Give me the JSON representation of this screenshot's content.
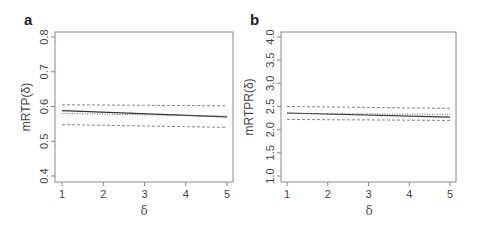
{
  "chart_data": [
    {
      "type": "line",
      "panel_label": "a",
      "title": "",
      "xlabel": "δ",
      "ylabel": "mRTP(δ)",
      "xlim": [
        1,
        5
      ],
      "ylim": [
        0.4,
        0.8
      ],
      "xticks": [
        "1",
        "2",
        "3",
        "4",
        "5"
      ],
      "yticks": [
        "0.4",
        "0.5",
        "0.6",
        "0.7",
        "0.8"
      ],
      "grid": false,
      "x": [
        1,
        5
      ],
      "series": [
        {
          "name": "upper bound",
          "style": "dashed",
          "values": [
            0.605,
            0.602
          ]
        },
        {
          "name": "estimate",
          "style": "solid",
          "values": [
            0.588,
            0.57
          ]
        },
        {
          "name": "reference",
          "style": "dotted",
          "values": [
            0.58,
            0.572
          ]
        },
        {
          "name": "lower bound",
          "style": "dashed",
          "values": [
            0.548,
            0.54
          ]
        }
      ]
    },
    {
      "type": "line",
      "panel_label": "b",
      "title": "",
      "xlabel": "δ",
      "ylabel": "mRTPR(δ)",
      "xlim": [
        1,
        5
      ],
      "ylim": [
        1.0,
        4.0
      ],
      "xticks": [
        "1",
        "2",
        "3",
        "4",
        "5"
      ],
      "yticks": [
        "1.0",
        "1.5",
        "2.0",
        "2.5",
        "3.0",
        "3.5",
        "4.0"
      ],
      "grid": false,
      "x": [
        1,
        5
      ],
      "series": [
        {
          "name": "upper bound",
          "style": "dashed",
          "values": [
            2.5,
            2.46
          ]
        },
        {
          "name": "estimate",
          "style": "solid",
          "values": [
            2.36,
            2.27
          ]
        },
        {
          "name": "reference",
          "style": "dotted",
          "values": [
            2.35,
            2.33
          ]
        },
        {
          "name": "lower bound",
          "style": "dashed",
          "values": [
            2.22,
            2.2
          ]
        }
      ]
    }
  ]
}
